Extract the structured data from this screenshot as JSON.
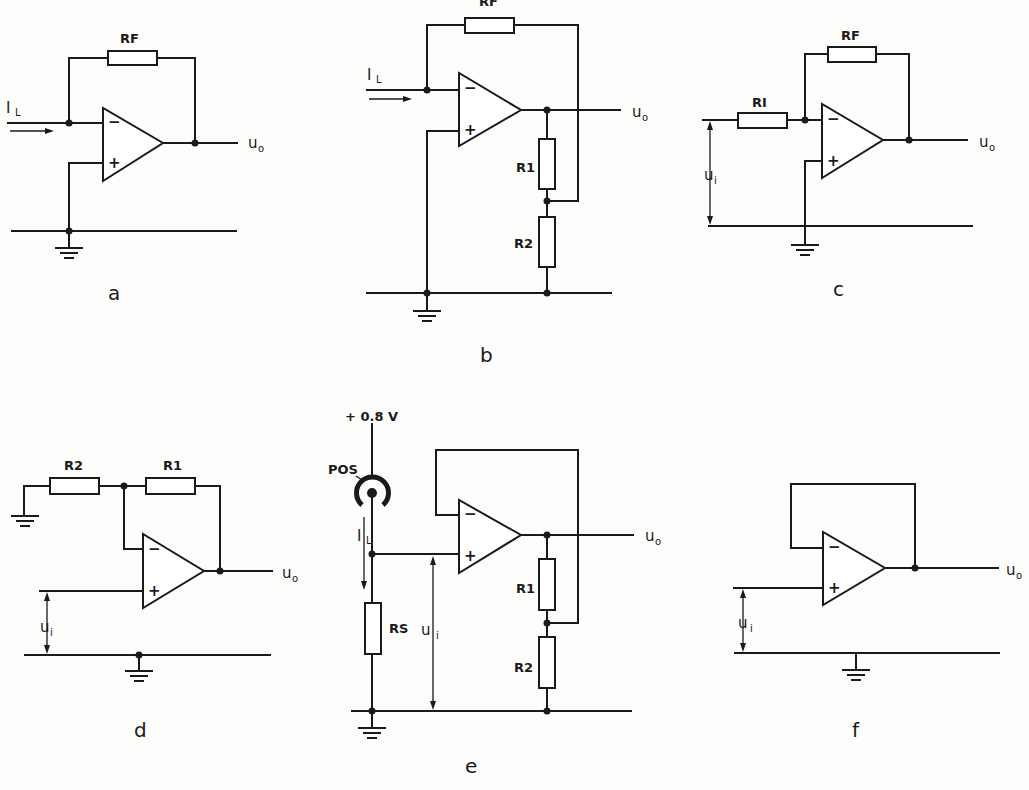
{
  "figure": {
    "panels": [
      {
        "id": "a",
        "caption": "a",
        "description": "Current-to-voltage converter (transimpedance amplifier)",
        "components": {
          "feedback_resistor": "RF"
        },
        "labels": {
          "input_current": "I",
          "input_current_sub": "L",
          "output": "u",
          "output_sub": "o"
        },
        "opamp": {
          "minus": "−",
          "plus": "+"
        }
      },
      {
        "id": "b",
        "caption": "b",
        "description": "Current-to-voltage converter with T-network feedback (gain boost via R1/R2 divider)",
        "components": {
          "feedback_resistor": "RF",
          "divider_top": "R1",
          "divider_bottom": "R2"
        },
        "labels": {
          "input_current": "I",
          "input_current_sub": "L",
          "output": "u",
          "output_sub": "o"
        },
        "opamp": {
          "minus": "−",
          "plus": "+"
        }
      },
      {
        "id": "c",
        "caption": "c",
        "description": "Inverting voltage amplifier",
        "components": {
          "input_resistor": "RI",
          "feedback_resistor": "RF"
        },
        "labels": {
          "input_voltage": "u",
          "input_voltage_sub": "i",
          "output": "u",
          "output_sub": "o"
        },
        "opamp": {
          "minus": "−",
          "plus": "+"
        }
      },
      {
        "id": "d",
        "caption": "d",
        "description": "Non-inverting voltage amplifier",
        "components": {
          "ground_resistor": "R2",
          "feedback_resistor": "R1"
        },
        "labels": {
          "input_voltage": "u",
          "input_voltage_sub": "i",
          "output": "u",
          "output_sub": "o"
        },
        "opamp": {
          "minus": "−",
          "plus": "+"
        }
      },
      {
        "id": "e",
        "caption": "e",
        "description": "Photodiode (POS) with bias +0.8 V, load resistor RS, non-inverting amplifier R1/R2",
        "components": {
          "sensor": "POS",
          "bias": "+ 0.8 V",
          "sense_resistor": "RS",
          "divider_top": "R1",
          "divider_bottom": "R2"
        },
        "labels": {
          "input_current": "I",
          "input_current_sub": "L",
          "input_voltage": "u",
          "input_voltage_sub": "i",
          "output": "u",
          "output_sub": "o"
        },
        "opamp": {
          "minus": "−",
          "plus": "+"
        }
      },
      {
        "id": "f",
        "caption": "f",
        "description": "Voltage follower (unity-gain buffer)",
        "components": {},
        "labels": {
          "input_voltage": "u",
          "input_voltage_sub": "i",
          "output": "u",
          "output_sub": "o"
        },
        "opamp": {
          "minus": "−",
          "plus": "+"
        }
      }
    ]
  },
  "colors": {
    "ink": "#1a1a1a",
    "paper": "#fdfdfc"
  }
}
